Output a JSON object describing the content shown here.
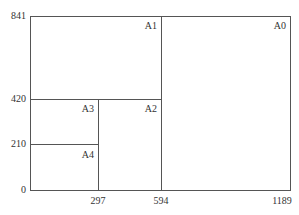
{
  "diagram": {
    "type": "paper-size-subdivision",
    "y_ticks": [
      "841",
      "420",
      "210",
      "0"
    ],
    "x_ticks": [
      "297",
      "594",
      "1189"
    ],
    "areas": [
      "A0",
      "A1",
      "A2",
      "A3",
      "A4"
    ],
    "line_color": "#555555",
    "text_color": "#333333"
  }
}
